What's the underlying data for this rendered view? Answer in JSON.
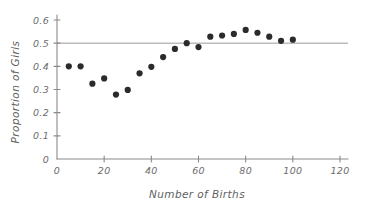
{
  "chart_data": {
    "type": "scatter",
    "title": "",
    "xlabel": "Number of Births",
    "ylabel": "Proportion of Girls",
    "xlim": [
      0,
      120
    ],
    "ylim": [
      0,
      0.6
    ],
    "xticks": [
      0,
      20,
      40,
      60,
      80,
      100,
      120
    ],
    "xtick_labels": [
      "0",
      "20",
      "40",
      "60",
      "80",
      "100",
      "120"
    ],
    "yticks": [
      0,
      0.1,
      0.2,
      0.3,
      0.4,
      0.5,
      0.6
    ],
    "ytick_labels": [
      "0",
      "0.1",
      "0.2",
      "0.3",
      "0.4",
      "0.5",
      "0.6"
    ],
    "grid": false,
    "legend": null,
    "point_color": "#2b2b2b",
    "axis_color": "#8a8a8a",
    "reference_line": {
      "orientation": "horizontal",
      "y": 0.5,
      "label": "",
      "color": "#9a9a9a",
      "x_start": 0,
      "x_end": 120
    },
    "x": [
      5,
      10,
      15,
      20,
      25,
      30,
      35,
      40,
      45,
      50,
      55,
      60,
      65,
      70,
      75,
      80,
      85,
      90,
      95,
      100
    ],
    "y": [
      0.4,
      0.4,
      0.325,
      0.348,
      0.278,
      0.298,
      0.37,
      0.398,
      0.44,
      0.475,
      0.5,
      0.483,
      0.528,
      0.533,
      0.54,
      0.557,
      0.545,
      0.528,
      0.51,
      0.515
    ]
  }
}
